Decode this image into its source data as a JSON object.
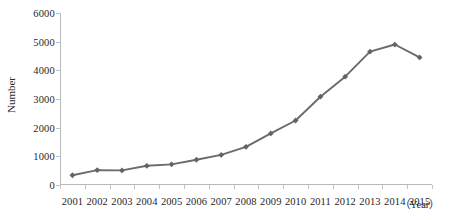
{
  "chart_data": {
    "type": "line",
    "title": "",
    "subtitle": "",
    "xlabel": "（Year）",
    "ylabel": "Number",
    "grid": false,
    "legend": false,
    "legend_position": "none",
    "xlim_categories": [
      "2001",
      "2002",
      "2003",
      "2004",
      "2005",
      "2006",
      "2007",
      "2008",
      "2009",
      "2010",
      "2011",
      "2012",
      "2013",
      "2014",
      "2015"
    ],
    "ylim": [
      0,
      6000
    ],
    "yticks": [
      0,
      1000,
      2000,
      3000,
      4000,
      5000,
      6000
    ],
    "ytick_labels": [
      "0",
      "1000",
      "2000",
      "3000",
      "4000",
      "5000",
      "6000"
    ],
    "categories": [
      "2001",
      "2002",
      "2003",
      "2004",
      "2005",
      "2006",
      "2007",
      "2008",
      "2009",
      "2010",
      "2011",
      "2012",
      "2013",
      "2014",
      "2015"
    ],
    "values": [
      340,
      520,
      510,
      670,
      720,
      880,
      1050,
      1330,
      1800,
      2250,
      3080,
      3780,
      4650,
      4900,
      4450
    ],
    "series": [
      {
        "name": "Number",
        "values": [
          340,
          520,
          510,
          670,
          720,
          880,
          1050,
          1330,
          1800,
          2250,
          3080,
          3780,
          4650,
          4900,
          4450
        ]
      }
    ],
    "marker": "diamond",
    "line_color": "#6b6b6b",
    "marker_color": "#636363",
    "axis_color": "#b9b9b9",
    "text_color": "#1f1f1f",
    "background": "#ffffff"
  }
}
